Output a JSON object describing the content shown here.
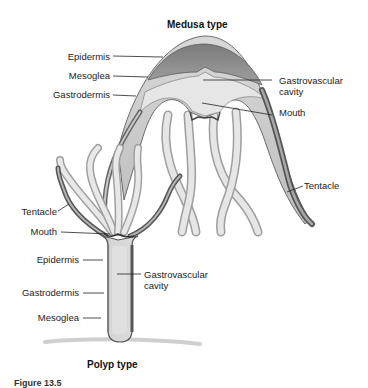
{
  "diagram": {
    "medusa": {
      "title": "Medusa type",
      "labels": {
        "epidermis": "Epidermis",
        "mesoglea": "Mesoglea",
        "gastrodermis": "Gastrodermis",
        "gastrovascular_cavity_line1": "Gastrovascular",
        "gastrovascular_cavity_line2": "cavity",
        "mouth": "Mouth",
        "tentacle": "Tentacle"
      }
    },
    "polyp": {
      "title": "Polyp type",
      "labels": {
        "tentacle": "Tentacle",
        "mouth": "Mouth",
        "epidermis": "Epidermis",
        "gastrovascular_cavity_line1": "Gastrovascular",
        "gastrovascular_cavity_line2": "cavity",
        "gastrodermis": "Gastrodermis",
        "mesoglea": "Mesoglea"
      }
    },
    "caption": "Figure 13.5"
  },
  "colors": {
    "epidermis": "#c9c9c9",
    "mesoglea": "#8a8a8a",
    "gastrodermis": "#b5b5b5",
    "cavity": "#e4e4e4",
    "outline": "#555555",
    "leader": "#222222"
  }
}
